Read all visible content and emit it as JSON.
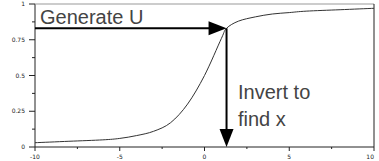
{
  "chart_data": {
    "type": "line",
    "title": "",
    "xlabel": "",
    "ylabel": "",
    "xlim": [
      -10,
      10
    ],
    "ylim": [
      0,
      1
    ],
    "x_ticks": [
      -10,
      -5,
      0,
      5,
      10
    ],
    "x_tick_labels": [
      "-10",
      "-5",
      "0",
      "5",
      "10"
    ],
    "x_minor_ticks": [
      -7.5,
      -2.5,
      2.5,
      7.5
    ],
    "y_ticks": [
      0,
      0.25,
      0.5,
      0.75,
      1
    ],
    "y_tick_labels": [
      "0",
      "0.25",
      "0.5",
      "0.75",
      "1"
    ],
    "y_minor_ticks": [
      0.125,
      0.375,
      0.625,
      0.875
    ],
    "grid": false,
    "series": [
      {
        "name": "CDF",
        "description": "S-shaped cumulative distribution, approx. logistic centered near x=0",
        "x": [
          -10,
          -8,
          -6,
          -5,
          -4,
          -3,
          -2,
          -1,
          0,
          1,
          1.3,
          2,
          3,
          4,
          5,
          6,
          8,
          10
        ],
        "y": [
          0.03,
          0.04,
          0.05,
          0.06,
          0.08,
          0.11,
          0.17,
          0.3,
          0.5,
          0.76,
          0.83,
          0.88,
          0.91,
          0.93,
          0.94,
          0.95,
          0.96,
          0.97
        ]
      }
    ],
    "annotations": [
      {
        "text": "Generate U",
        "type": "horizontal-arrow",
        "from": [
          -10,
          0.83
        ],
        "to": [
          1.3,
          0.83
        ]
      },
      {
        "text": "Invert to find x",
        "lines": [
          "Invert to",
          "find x"
        ],
        "type": "vertical-arrow",
        "from": [
          1.3,
          0.83
        ],
        "to": [
          1.3,
          0
        ]
      }
    ]
  }
}
